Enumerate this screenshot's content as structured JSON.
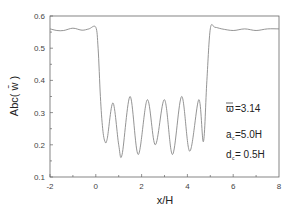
{
  "chart_data": {
    "type": "line",
    "title": "",
    "xlabel": "x/H",
    "ylabel": "Abc( w̄ )",
    "xlim": [
      -2,
      8
    ],
    "ylim": [
      0.1,
      0.6
    ],
    "xticks": [
      "-2",
      "0",
      "2",
      "4",
      "6",
      "8"
    ],
    "yticks": [
      "0.1",
      "0.2",
      "0.3",
      "0.4",
      "0.5",
      "0.6"
    ],
    "grid": false,
    "legend": null,
    "annotations": [
      "ϖ̄ =3.14",
      "a_c =5.0H",
      "d_c = 0.5H"
    ],
    "series": [
      {
        "name": "Abc(w̄)",
        "color": "#888888",
        "x": [
          -2,
          -1.7,
          -1.4,
          -1.0,
          -0.6,
          -0.3,
          0.0,
          0.1,
          0.2,
          0.3,
          0.4,
          0.5,
          0.75,
          1.0,
          1.15,
          1.5,
          1.85,
          2.25,
          2.6,
          3.0,
          3.35,
          3.75,
          4.1,
          4.5,
          4.7,
          4.85,
          5.0,
          5.2,
          5.5,
          6.0,
          6.5,
          7.0,
          7.5,
          8.0
        ],
        "y": [
          0.56,
          0.555,
          0.555,
          0.562,
          0.556,
          0.56,
          0.565,
          0.5,
          0.35,
          0.25,
          0.21,
          0.22,
          0.33,
          0.2,
          0.17,
          0.35,
          0.17,
          0.34,
          0.2,
          0.34,
          0.17,
          0.35,
          0.18,
          0.34,
          0.21,
          0.4,
          0.56,
          0.565,
          0.56,
          0.555,
          0.56,
          0.555,
          0.56,
          0.56
        ]
      }
    ]
  },
  "annotations": {
    "omega": "=3.14",
    "ac": "=5.0H",
    "dc": "= 0.5H"
  }
}
